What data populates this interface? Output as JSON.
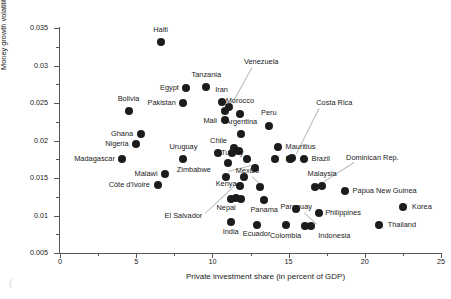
{
  "chart_data": {
    "type": "scatter",
    "title": "",
    "xlabel": "Private investment share (in percent of GDP)",
    "ylabel": "Money growth volatility 1/",
    "xlim": [
      0,
      25
    ],
    "ylim": [
      0.005,
      0.035
    ],
    "xticks": [
      0,
      5,
      10,
      15,
      20,
      25
    ],
    "xticklabels": [
      "0",
      "5",
      "10",
      "15",
      "20",
      "25"
    ],
    "yticks": [
      0.005,
      0.01,
      0.015,
      0.02,
      0.025,
      0.03,
      0.035
    ],
    "yticklabels": [
      "0.005",
      "0.01",
      "0.015",
      "0.02",
      "0.025",
      "0.03",
      "0.035"
    ],
    "grid": false,
    "legend": null,
    "marker_color": "#1c1c1c",
    "points": [
      {
        "label": "Haiti",
        "x": 6.6,
        "y": 0.0331,
        "lx": 6.6,
        "ly": 0.0347,
        "anchor": "c"
      },
      {
        "label": "Tanzania",
        "x": 9.6,
        "y": 0.0271,
        "lx": 9.6,
        "ly": 0.0288,
        "anchor": "c"
      },
      {
        "label": "Egypt",
        "x": 8.3,
        "y": 0.027,
        "lx": 7.8,
        "ly": 0.027,
        "anchor": "r"
      },
      {
        "label": "Iran",
        "x": 10.6,
        "y": 0.0251,
        "lx": 10.6,
        "ly": 0.0268,
        "anchor": "c"
      },
      {
        "label": "Pakistan",
        "x": 8.1,
        "y": 0.025,
        "lx": 7.6,
        "ly": 0.025,
        "anchor": "r"
      },
      {
        "label": "Bolivia",
        "x": 4.5,
        "y": 0.024,
        "lx": 4.5,
        "ly": 0.0256,
        "anchor": "c"
      },
      {
        "label": "Morocco",
        "x": 11.8,
        "y": 0.0236,
        "lx": 11.8,
        "ly": 0.0253,
        "anchor": "c"
      },
      {
        "label": "Mali",
        "x": 10.8,
        "y": 0.024,
        "lx": 10.3,
        "ly": 0.0226,
        "anchor": "r"
      },
      {
        "label": "Peru",
        "x": 13.7,
        "y": 0.022,
        "lx": 13.7,
        "ly": 0.0237,
        "anchor": "c"
      },
      {
        "label": "Ghana",
        "x": 5.3,
        "y": 0.0209,
        "lx": 4.8,
        "ly": 0.0209,
        "anchor": "r"
      },
      {
        "label": "Argentina",
        "x": 11.9,
        "y": 0.0209,
        "lx": 11.9,
        "ly": 0.0225,
        "anchor": "c"
      },
      {
        "label": "Nigeria",
        "x": 5.0,
        "y": 0.0196,
        "lx": 4.5,
        "ly": 0.0196,
        "anchor": "r"
      },
      {
        "label": "Mauritius",
        "x": 14.3,
        "y": 0.0191,
        "lx": 14.8,
        "ly": 0.0191,
        "anchor": "l"
      },
      {
        "label": "Madagascar",
        "x": 4.1,
        "y": 0.0175,
        "lx": 3.6,
        "ly": 0.0175,
        "anchor": "r"
      },
      {
        "label": "Uruguay",
        "x": 8.1,
        "y": 0.0176,
        "lx": 8.1,
        "ly": 0.0192,
        "anchor": "c"
      },
      {
        "label": "Chile",
        "x": 10.4,
        "y": 0.0184,
        "lx": 10.4,
        "ly": 0.02,
        "anchor": "c"
      },
      {
        "label": "Turkey",
        "x": 11.3,
        "y": 0.0183,
        "lx": 11.3,
        "ly": 0.0183,
        "anchor": "c"
      },
      {
        "label": "Fiji",
        "x": 15.1,
        "y": 0.0175,
        "lx": 15.1,
        "ly": 0.0176,
        "anchor": "c"
      },
      {
        "label": "Brazil",
        "x": 16.0,
        "y": 0.0176,
        "lx": 16.5,
        "ly": 0.0176,
        "anchor": "l"
      },
      {
        "label": "Zimbabwe",
        "x": 11.0,
        "y": 0.017,
        "lx": 9.9,
        "ly": 0.0161,
        "anchor": "r"
      },
      {
        "label": "Malawi",
        "x": 6.9,
        "y": 0.0156,
        "lx": 6.4,
        "ly": 0.0156,
        "anchor": "r"
      },
      {
        "label": "Kenya",
        "x": 10.9,
        "y": 0.0152,
        "lx": 10.9,
        "ly": 0.0142,
        "anchor": "c"
      },
      {
        "label": "Mexico",
        "x": 13.1,
        "y": 0.0138,
        "lx": 12.3,
        "ly": 0.016,
        "anchor": "c"
      },
      {
        "label": "Côte d'Ivoire",
        "x": 6.4,
        "y": 0.0141,
        "lx": 5.9,
        "ly": 0.0141,
        "anchor": "r"
      },
      {
        "label": "Malaysia",
        "x": 17.2,
        "y": 0.0139,
        "lx": 17.2,
        "ly": 0.0155,
        "anchor": "c"
      },
      {
        "label": "Papua New Guinea",
        "x": 18.7,
        "y": 0.0133,
        "lx": 19.2,
        "ly": 0.0133,
        "anchor": "l"
      },
      {
        "label": "Nepal",
        "x": 11.2,
        "y": 0.0122,
        "lx": 10.9,
        "ly": 0.011,
        "anchor": "c"
      },
      {
        "label": "Panama",
        "x": 13.4,
        "y": 0.0121,
        "lx": 13.4,
        "ly": 0.0108,
        "anchor": "c"
      },
      {
        "label": "Paraguay",
        "x": 15.5,
        "y": 0.0109,
        "lx": 15.5,
        "ly": 0.0111,
        "anchor": "c"
      },
      {
        "label": "Korea",
        "x": 22.5,
        "y": 0.0111,
        "lx": 23.1,
        "ly": 0.0111,
        "anchor": "l"
      },
      {
        "label": "Philippines",
        "x": 17.0,
        "y": 0.0104,
        "lx": 17.4,
        "ly": 0.0104,
        "anchor": "l"
      },
      {
        "label": "India",
        "x": 11.2,
        "y": 0.0091,
        "lx": 11.2,
        "ly": 0.0078,
        "anchor": "c"
      },
      {
        "label": "Ecuador",
        "x": 12.9,
        "y": 0.0088,
        "lx": 12.9,
        "ly": 0.0075,
        "anchor": "c"
      },
      {
        "label": "Colombia",
        "x": 14.8,
        "y": 0.0087,
        "lx": 14.8,
        "ly": 0.0073,
        "anchor": "c"
      },
      {
        "label": "Indonesia",
        "x": 16.1,
        "y": 0.0086,
        "lx": 18.0,
        "ly": 0.0073,
        "anchor": "c"
      },
      {
        "label": "Thailand",
        "x": 20.9,
        "y": 0.0087,
        "lx": 21.5,
        "ly": 0.0087,
        "anchor": "l"
      },
      {
        "label": "Venezuela",
        "x": 11.1,
        "y": 0.0245,
        "lx": 13.2,
        "ly": 0.0305,
        "anchor": "c"
      },
      {
        "label": "Costa Rica",
        "x": 15.2,
        "y": 0.0177,
        "lx": 18.0,
        "ly": 0.025,
        "anchor": "c"
      },
      {
        "label": "Dominican Rep.",
        "x": 16.7,
        "y": 0.0138,
        "lx": 20.5,
        "ly": 0.0177,
        "anchor": "c"
      },
      {
        "label": "El Salvador",
        "x": 11.8,
        "y": 0.0139,
        "lx": 8.1,
        "ly": 0.01,
        "anchor": "c"
      }
    ],
    "extra_points": [
      {
        "x": 16.5,
        "y": 0.0086
      },
      {
        "x": 11.55,
        "y": 0.0123
      },
      {
        "x": 11.45,
        "y": 0.019
      },
      {
        "x": 11.75,
        "y": 0.0186
      },
      {
        "x": 12.1,
        "y": 0.0152
      },
      {
        "x": 12.3,
        "y": 0.0176
      },
      {
        "x": 14.1,
        "y": 0.0176
      },
      {
        "x": 12.8,
        "y": 0.0164
      },
      {
        "x": 11.9,
        "y": 0.0122
      },
      {
        "x": 10.8,
        "y": 0.0228
      }
    ],
    "leaders": [
      {
        "from": [
          12.6,
          0.0298
        ],
        "to": [
          11.35,
          0.0252
        ]
      },
      {
        "from": [
          17.0,
          0.0243
        ],
        "to": [
          15.5,
          0.0182
        ]
      },
      {
        "from": [
          19.3,
          0.0172
        ],
        "to": [
          17.0,
          0.0142
        ]
      },
      {
        "from": [
          9.5,
          0.0103
        ],
        "to": [
          11.6,
          0.0143
        ]
      },
      {
        "from": [
          11.0,
          0.0159
        ],
        "to": [
          12.55,
          0.0167
        ]
      },
      {
        "from": [
          12.6,
          0.0153
        ],
        "to": [
          13.2,
          0.0141
        ]
      },
      {
        "from": [
          16.0,
          0.0105
        ],
        "to": [
          16.8,
          0.009
        ]
      }
    ]
  },
  "artifact": "("
}
